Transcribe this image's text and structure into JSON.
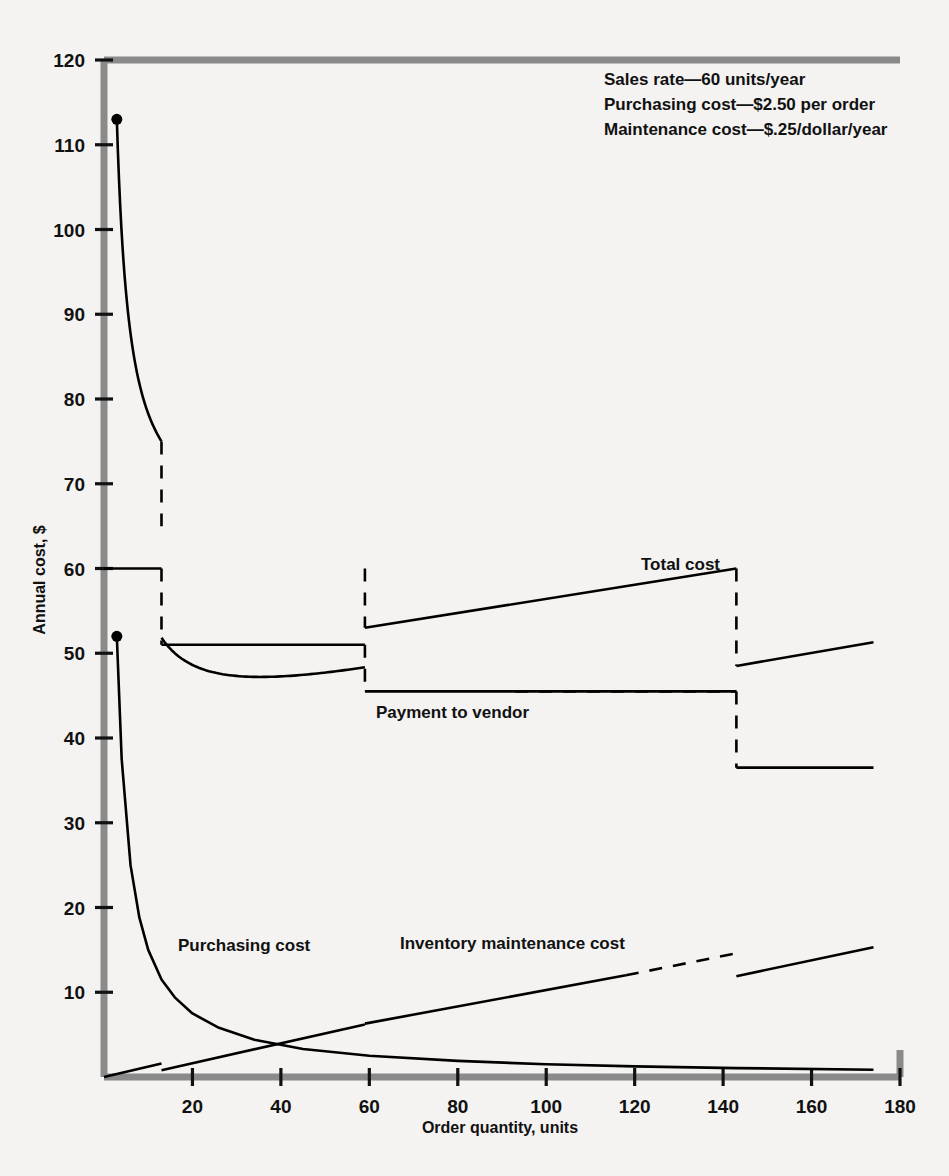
{
  "chart_data": {
    "type": "line",
    "title": "",
    "xlabel": "Order quantity, units",
    "ylabel": "Annual cost, $",
    "xlim": [
      0,
      180
    ],
    "ylim": [
      0,
      120
    ],
    "xticks": [
      20,
      40,
      60,
      80,
      100,
      120,
      140,
      160,
      180
    ],
    "yticks": [
      10,
      20,
      30,
      40,
      50,
      60,
      70,
      80,
      90,
      100,
      110,
      120
    ],
    "grid": false,
    "legend_position": "inline-annotations",
    "annotations": {
      "notes": [
        "Sales rate—60 units/year",
        "Purchasing cost—$2.50 per order",
        "Maintenance cost—$.25/dollar/year"
      ],
      "note_values": {
        "sales_rate_units_per_year": 60,
        "purchasing_cost_per_order": 2.5,
        "maintenance_cost_per_dollar_per_year": 0.25
      }
    },
    "price_breaks": [
      {
        "quantity": 13,
        "unit_price": 1.0,
        "note": "first quantity discount break"
      },
      {
        "quantity": 59,
        "unit_price": 0.85,
        "note": "second quantity discount break"
      },
      {
        "quantity": 143,
        "unit_price": 0.61,
        "note": "third quantity discount break"
      }
    ],
    "series": [
      {
        "name": "Total cost",
        "label": "Total cost",
        "style": "solid-with-dashed-jumps",
        "segments": [
          {
            "from": 2.9,
            "to": 13,
            "y_from": 113,
            "y_to": 75
          },
          {
            "from": 13,
            "to": 59,
            "y_from": 65,
            "y_to": 60
          },
          {
            "from": 59,
            "to": 143,
            "y_from": 53,
            "y_to": 60
          },
          {
            "from": 143,
            "to": 174,
            "y_from": 48.5,
            "y_to": 51.3
          }
        ],
        "jumps": [
          {
            "quantity": 13,
            "from": 75,
            "to": 65
          },
          {
            "quantity": 59,
            "from": 60,
            "to": 53
          },
          {
            "quantity": 143,
            "from": 60,
            "to": 48.5
          }
        ],
        "start_point": {
          "quantity": 2.9,
          "value": 113
        }
      },
      {
        "name": "Payment to vendor",
        "label": "Payment to vendor",
        "style": "solid-with-dashed-jumps",
        "segments": [
          {
            "from": 0,
            "to": 13,
            "y_from": 60,
            "y_to": 60
          },
          {
            "from": 13,
            "to": 59,
            "y_from": 51,
            "y_to": 51
          },
          {
            "from": 59,
            "to": 143,
            "y_from": 45.5,
            "y_to": 45.5
          },
          {
            "from": 143,
            "to": 174,
            "y_from": 36.5,
            "y_to": 36.5
          }
        ],
        "jumps": [
          {
            "quantity": 13,
            "from": 60,
            "to": 51
          },
          {
            "quantity": 59,
            "from": 51,
            "to": 45.5
          },
          {
            "quantity": 143,
            "from": 45.5,
            "to": 36.5
          }
        ]
      },
      {
        "name": "Purchasing cost",
        "label": "Purchasing cost",
        "style": "solid",
        "formula": "150 / Q",
        "start_point": {
          "quantity": 2.9,
          "value": 52
        },
        "points": [
          {
            "x": 2.9,
            "y": 52
          },
          {
            "x": 4,
            "y": 37.5
          },
          {
            "x": 6,
            "y": 25
          },
          {
            "x": 8,
            "y": 18.8
          },
          {
            "x": 10,
            "y": 15
          },
          {
            "x": 13,
            "y": 11.5
          },
          {
            "x": 16,
            "y": 9.4
          },
          {
            "x": 20,
            "y": 7.5
          },
          {
            "x": 26,
            "y": 5.8
          },
          {
            "x": 34,
            "y": 4.4
          },
          {
            "x": 45,
            "y": 3.3
          },
          {
            "x": 60,
            "y": 2.5
          },
          {
            "x": 80,
            "y": 1.9
          },
          {
            "x": 100,
            "y": 1.5
          },
          {
            "x": 120,
            "y": 1.25
          },
          {
            "x": 143,
            "y": 1.05
          },
          {
            "x": 174,
            "y": 0.86
          }
        ]
      },
      {
        "name": "Inventory maintenance cost",
        "label": "Inventory maintenance cost",
        "style": "piecewise-linear-with-dashed-section",
        "segments": [
          {
            "from": 0,
            "to": 13,
            "y_from": 0,
            "y_to": 1.6
          },
          {
            "from": 13,
            "to": 59,
            "y_from": 0.8,
            "y_to": 6.2
          },
          {
            "from": 59,
            "to": 118,
            "y_from": 6.3,
            "y_to": 12.0
          },
          {
            "from": 118,
            "to": 143,
            "y_from": 12.0,
            "y_to": 14.6,
            "dashed": true
          },
          {
            "from": 143,
            "to": 174,
            "y_from": 11.9,
            "y_to": 15.3
          }
        ]
      }
    ]
  },
  "axes": {
    "x_title": "Order quantity, units",
    "y_title": "Annual cost, $",
    "x_tick_labels": [
      "20",
      "40",
      "60",
      "80",
      "100",
      "120",
      "140",
      "160",
      "180"
    ],
    "y_tick_labels": [
      "10",
      "20",
      "30",
      "40",
      "50",
      "60",
      "70",
      "80",
      "90",
      "100",
      "110",
      "120"
    ]
  },
  "labels": {
    "total_cost": "Total cost",
    "payment_to_vendor": "Payment to vendor",
    "purchasing_cost": "Purchasing cost",
    "inventory_maintenance_cost": "Inventory maintenance cost"
  },
  "notes": {
    "line1": "Sales rate—60 units/year",
    "line2": "Purchasing cost—$2.50 per order",
    "line3": "Maintenance cost—$.25/dollar/year"
  },
  "colors": {
    "background": "#f4f3f1",
    "frame": "#8a8a8a",
    "ink": "#000000"
  }
}
